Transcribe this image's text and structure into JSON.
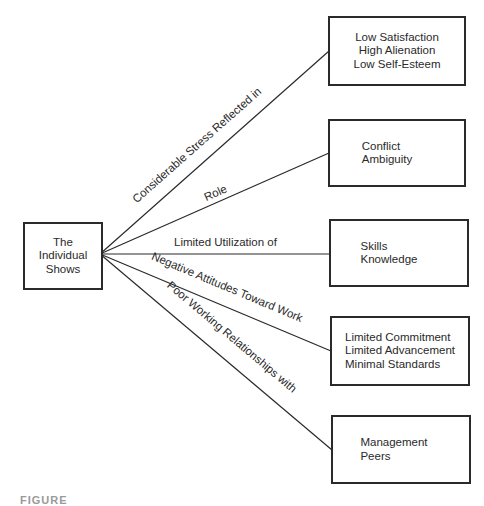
{
  "diagram": {
    "source": {
      "label": "The\nIndividual\nShows"
    },
    "branches": [
      {
        "edge_label": "Considerable Stress Reflected in",
        "target": "Low Satisfaction\nHigh Alienation\nLow Self-Esteem"
      },
      {
        "edge_label": "Role",
        "target": "Conflict\nAmbiguity"
      },
      {
        "edge_label": "Limited Utilization of",
        "target": "Skills\nKnowledge"
      },
      {
        "edge_label": "Negative Attitudes Toward Work",
        "target": "Limited Commitment\nLimited Advancement\nMinimal Standards"
      },
      {
        "edge_label": "Poor Working Relationships with",
        "target": "Management\nPeers"
      }
    ],
    "caption": "FIGURE"
  },
  "colors": {
    "stroke": "#2a2a2a",
    "background": "#ffffff"
  }
}
